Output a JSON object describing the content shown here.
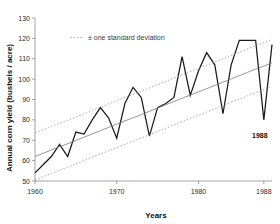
{
  "chart_data": {
    "type": "line",
    "title": "",
    "xlabel": "Years",
    "ylabel": "Annual corn yield (bushels / acre)",
    "xlim": [
      1960,
      1989
    ],
    "ylim": [
      50,
      130
    ],
    "ytick_labels": [
      "50",
      "60",
      "70",
      "80",
      "90",
      "100",
      "110",
      "120",
      "130"
    ],
    "yticks": [
      50,
      60,
      70,
      80,
      90,
      100,
      110,
      120,
      130
    ],
    "xtick_labels": [
      "1960",
      "1970",
      "1980",
      "1988"
    ],
    "xticks": [
      1960,
      1970,
      1980,
      1988
    ],
    "grid": false,
    "legend_position": "top-left-inside",
    "legend": [
      {
        "label": "± one standard deviation",
        "style": "dotted",
        "color": "#9a9a9a"
      }
    ],
    "annotations": [
      {
        "label": "1988",
        "x": 1988,
        "y": 80,
        "note": "drought year minimum"
      }
    ],
    "x": [
      1960,
      1961,
      1962,
      1963,
      1964,
      1965,
      1966,
      1967,
      1968,
      1969,
      1970,
      1971,
      1972,
      1973,
      1974,
      1975,
      1976,
      1977,
      1978,
      1979,
      1980,
      1981,
      1982,
      1983,
      1984,
      1985,
      1986,
      1987,
      1988,
      1989
    ],
    "series": [
      {
        "name": "Annual corn yield",
        "style": "solid",
        "color": "#1a1a1a",
        "values": [
          54,
          58,
          62,
          68,
          62,
          74,
          73,
          80,
          86,
          81,
          71,
          88,
          96,
          91,
          72,
          86,
          88,
          91,
          111,
          92,
          104,
          113,
          107,
          83,
          107,
          119,
          119,
          119,
          80,
          117
        ]
      },
      {
        "name": "Linear trend",
        "style": "solid",
        "color": "#7a7a7a",
        "values": [
          62.0,
          63.6,
          65.2,
          66.8,
          68.3,
          69.9,
          71.5,
          73.1,
          74.7,
          76.3,
          77.9,
          79.5,
          81.0,
          82.6,
          84.2,
          85.8,
          87.4,
          89.0,
          90.6,
          92.2,
          93.7,
          95.3,
          96.9,
          98.5,
          100.1,
          101.7,
          103.3,
          104.9,
          106.4,
          108.0
        ]
      },
      {
        "name": "+ one standard deviation",
        "style": "dotted",
        "color": "#9a9a9a",
        "values": [
          73.5,
          75.1,
          76.7,
          78.3,
          79.8,
          81.4,
          83.0,
          84.6,
          86.2,
          87.8,
          89.4,
          91.0,
          92.5,
          94.1,
          95.7,
          97.3,
          98.9,
          100.5,
          102.1,
          103.7,
          105.2,
          106.8,
          108.4,
          110.0,
          111.6,
          113.2,
          114.8,
          116.4,
          117.9,
          119.5
        ]
      },
      {
        "name": "- one standard deviation",
        "style": "dotted",
        "color": "#9a9a9a",
        "values": [
          50.5,
          52.1,
          53.7,
          55.3,
          56.8,
          58.4,
          60.0,
          61.6,
          63.2,
          64.8,
          66.4,
          68.0,
          69.5,
          71.1,
          72.7,
          74.3,
          75.9,
          77.5,
          79.1,
          80.7,
          82.2,
          83.8,
          85.4,
          87.0,
          88.6,
          90.2,
          91.8,
          93.4,
          94.9,
          96.5
        ]
      }
    ]
  }
}
